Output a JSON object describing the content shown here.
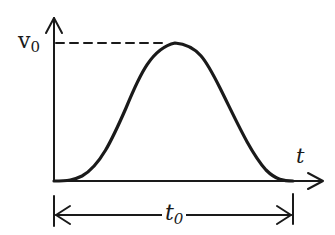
{
  "diagram": {
    "type": "velocity-time pulse",
    "y_axis_label": {
      "base": "v",
      "sub": "0"
    },
    "x_axis_label": "t",
    "duration_label": {
      "base": "t",
      "sub": "0"
    },
    "stroke_color": "#1a1a1a"
  }
}
